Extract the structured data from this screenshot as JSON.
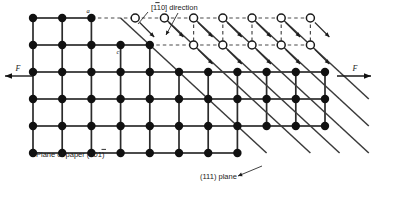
{
  "figure": {
    "plane_of_paper_label": "Plane of paper (00",
    "plane_of_paper_index_bar": "1",
    "plane_of_paper_tail": ")",
    "direction_label_bracket_open": "[",
    "direction_label_bar_digit": "1",
    "direction_label_rest": "10] ",
    "direction_label_word": "direction",
    "slip_plane_label": "(111) plane",
    "force_left_label": "F",
    "force_right_label": "F",
    "point_label_a": "a",
    "point_label_c": "c"
  },
  "chart_data": {
    "type": "scatter",
    "xlabel": "",
    "ylabel": "",
    "grid": true,
    "legend": "none",
    "lattice": {
      "spacing_x": 29.2,
      "spacing_y": 27.0,
      "origin_x": 33,
      "origin_y": 18,
      "columns": 12,
      "rows": 6,
      "filled_marker": "closed-circle",
      "open_marker": "open-circle"
    },
    "rows": [
      {
        "index": 0,
        "y": 18,
        "filled_count": 3,
        "open_count": 7,
        "x_start": 33,
        "offset_open": 14.6
      },
      {
        "index": 1,
        "y": 45,
        "filled_count": 5,
        "open_count": 5,
        "x_start": 33,
        "offset_open": 14.6
      },
      {
        "index": 2,
        "y": 72,
        "filled_count": 11,
        "open_count": 0,
        "x_start": 33,
        "offset_open": 0
      },
      {
        "index": 3,
        "y": 99,
        "filled_count": 11,
        "open_count": 0,
        "x_start": 33,
        "offset_open": 0
      },
      {
        "index": 4,
        "y": 126,
        "filled_count": 11,
        "open_count": 0,
        "x_start": 33,
        "offset_open": 0
      },
      {
        "index": 5,
        "y": 153,
        "filled_count": 8,
        "open_count": 0,
        "x_start": 33,
        "offset_open": 0
      }
    ],
    "slip_arrows_row0_to_row1": 7,
    "slip_arrows_row1_to_row2": 5,
    "diagonal_slip_lines": 6,
    "force_arrows": [
      {
        "side": "left",
        "label": "F",
        "direction": "left",
        "y": 76
      },
      {
        "side": "right",
        "label": "F",
        "direction": "right",
        "y": 76
      }
    ],
    "annotations": [
      {
        "text": "[110] direction",
        "x": 150,
        "y": 9,
        "has_overbar_on": "first digit"
      },
      {
        "text": "Plane of paper (001)",
        "x": 36,
        "y": 155,
        "has_overbar_on": "last digit"
      },
      {
        "text": "(111) plane",
        "x": 200,
        "y": 176,
        "has_overbar_on": "none"
      },
      {
        "text": "a",
        "x": 92,
        "y": 12,
        "has_overbar_on": "none"
      },
      {
        "text": "c",
        "x": 116,
        "y": 49,
        "has_overbar_on": "none"
      }
    ]
  }
}
